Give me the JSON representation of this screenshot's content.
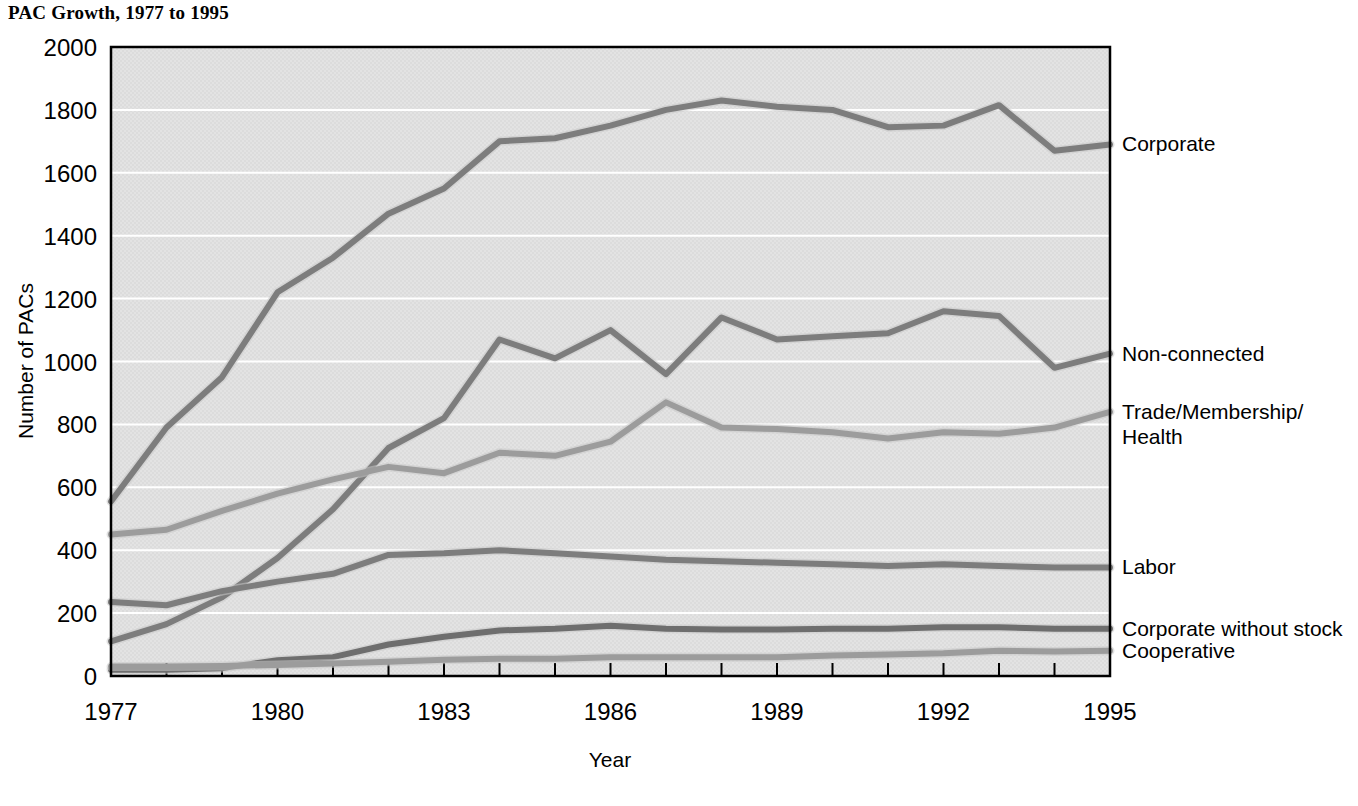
{
  "title": "PAC Growth, 1977 to 1995",
  "caption": "",
  "chart_data": {
    "type": "line",
    "title": "PAC Growth, 1977 to 1995",
    "xlabel": "Year",
    "ylabel": "Number of PACs",
    "xlim": [
      1977,
      1995
    ],
    "ylim": [
      0,
      2000
    ],
    "grid": true,
    "legend_position": "right-inline-labels",
    "x": [
      1977,
      1978,
      1979,
      1980,
      1981,
      1982,
      1983,
      1984,
      1985,
      1986,
      1987,
      1988,
      1989,
      1990,
      1991,
      1992,
      1993,
      1994,
      1995
    ],
    "xtick_labels": [
      "1977",
      "1980",
      "1983",
      "1986",
      "1989",
      "1992",
      "1995"
    ],
    "xticks": [
      1977,
      1980,
      1983,
      1986,
      1989,
      1992,
      1995
    ],
    "yticks": [
      0,
      200,
      400,
      600,
      800,
      1000,
      1200,
      1400,
      1600,
      1800,
      2000
    ],
    "ytick_labels": [
      "0",
      "200",
      "400",
      "600",
      "800",
      "1000",
      "1200",
      "1400",
      "1600",
      "1800",
      "2000"
    ],
    "series": [
      {
        "name": "Corporate",
        "color": "#7d7d7d",
        "label_y": 1690,
        "values": [
          555,
          790,
          950,
          1220,
          1330,
          1470,
          1550,
          1700,
          1710,
          1750,
          1800,
          1830,
          1810,
          1800,
          1745,
          1750,
          1815,
          1670,
          1690
        ]
      },
      {
        "name": "Non-connected",
        "color": "#7d7d7d",
        "label_y": 1025,
        "values": [
          110,
          165,
          250,
          375,
          530,
          725,
          820,
          1070,
          1010,
          1100,
          960,
          1140,
          1070,
          1080,
          1090,
          1160,
          1145,
          980,
          1025
        ]
      },
      {
        "name": "Trade/Membership/ Health",
        "color": "#9c9c9c",
        "label_y": 840,
        "values": [
          450,
          465,
          525,
          580,
          625,
          665,
          645,
          710,
          700,
          745,
          870,
          790,
          785,
          775,
          755,
          775,
          770,
          790,
          840
        ]
      },
      {
        "name": "Labor",
        "color": "#7d7d7d",
        "label_y": 345,
        "values": [
          235,
          225,
          270,
          300,
          325,
          385,
          390,
          400,
          390,
          380,
          370,
          365,
          360,
          355,
          350,
          355,
          350,
          345,
          345
        ]
      },
      {
        "name": "Corporate without stock",
        "color": "#6e6e6e",
        "label_y": 150,
        "values": [
          20,
          20,
          25,
          50,
          60,
          100,
          125,
          145,
          150,
          160,
          150,
          148,
          148,
          150,
          150,
          155,
          155,
          150,
          150
        ]
      },
      {
        "name": "Cooperative",
        "color": "#9c9c9c",
        "label_y": 80,
        "values": [
          30,
          30,
          32,
          35,
          40,
          45,
          52,
          55,
          55,
          60,
          60,
          60,
          60,
          65,
          68,
          72,
          80,
          78,
          80
        ]
      }
    ]
  },
  "labels": {
    "corporate": "Corporate",
    "non_connected": "Non-connected",
    "trade_1": "Trade/Membership/",
    "trade_2": "Health",
    "labor": "Labor",
    "corporate_without_stock": "Corporate without stock",
    "cooperative": "Cooperative"
  }
}
